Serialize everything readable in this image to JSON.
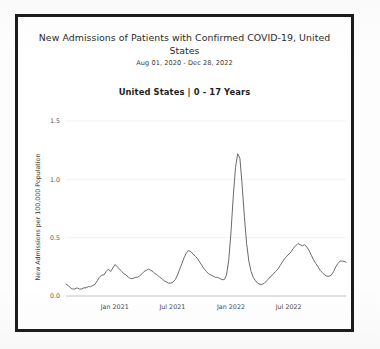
{
  "chart_data": {
    "type": "line",
    "title": "New Admissions of Patients with Confirmed COVID-19, United States",
    "subtitle": "Aug 01, 2020 - Dec 28, 2022",
    "panel_heading": "United States | 0 - 17 Years",
    "xlabel": "",
    "ylabel": "New Admissions per 100,000 Population",
    "ylim": [
      0.0,
      1.5
    ],
    "yticks": [
      0.0,
      0.5,
      1.0,
      1.5
    ],
    "ytick_labels": [
      "0.0",
      "0.5",
      "1.0",
      "1.5"
    ],
    "xlim": [
      "2020-08-01",
      "2022-12-28"
    ],
    "xticks": [
      "2021-01-01",
      "2021-07-01",
      "2022-01-01",
      "2022-07-01"
    ],
    "xtick_labels": [
      "Jan 2021",
      "Jul 2021",
      "Jan 2022",
      "Jul 2022"
    ],
    "grid": true,
    "legend": "none",
    "line_color": "#6a6a6a",
    "line_width": 1.0,
    "series": [
      {
        "name": "0 - 17 Years",
        "x": [
          "2020-08-01",
          "2020-08-08",
          "2020-08-15",
          "2020-08-22",
          "2020-08-29",
          "2020-09-05",
          "2020-09-12",
          "2020-09-19",
          "2020-09-26",
          "2020-10-03",
          "2020-10-10",
          "2020-10-17",
          "2020-10-24",
          "2020-10-31",
          "2020-11-07",
          "2020-11-14",
          "2020-11-21",
          "2020-11-28",
          "2020-12-05",
          "2020-12-12",
          "2020-12-19",
          "2020-12-26",
          "2021-01-02",
          "2021-01-09",
          "2021-01-16",
          "2021-01-23",
          "2021-01-30",
          "2021-02-06",
          "2021-02-13",
          "2021-02-20",
          "2021-02-27",
          "2021-03-06",
          "2021-03-13",
          "2021-03-20",
          "2021-03-27",
          "2021-04-03",
          "2021-04-10",
          "2021-04-17",
          "2021-04-24",
          "2021-05-01",
          "2021-05-08",
          "2021-05-15",
          "2021-05-22",
          "2021-05-29",
          "2021-06-05",
          "2021-06-12",
          "2021-06-19",
          "2021-06-26",
          "2021-07-03",
          "2021-07-10",
          "2021-07-17",
          "2021-07-24",
          "2021-07-31",
          "2021-08-07",
          "2021-08-14",
          "2021-08-21",
          "2021-08-28",
          "2021-09-04",
          "2021-09-11",
          "2021-09-18",
          "2021-09-25",
          "2021-10-02",
          "2021-10-09",
          "2021-10-16",
          "2021-10-23",
          "2021-10-30",
          "2021-11-06",
          "2021-11-13",
          "2021-11-20",
          "2021-11-27",
          "2021-12-04",
          "2021-12-11",
          "2021-12-18",
          "2021-12-25",
          "2022-01-01",
          "2022-01-08",
          "2022-01-15",
          "2022-01-22",
          "2022-01-29",
          "2022-02-05",
          "2022-02-12",
          "2022-02-19",
          "2022-02-26",
          "2022-03-05",
          "2022-03-12",
          "2022-03-19",
          "2022-03-26",
          "2022-04-02",
          "2022-04-09",
          "2022-04-16",
          "2022-04-23",
          "2022-04-30",
          "2022-05-07",
          "2022-05-14",
          "2022-05-21",
          "2022-05-28",
          "2022-06-04",
          "2022-06-11",
          "2022-06-18",
          "2022-06-25",
          "2022-07-02",
          "2022-07-09",
          "2022-07-16",
          "2022-07-23",
          "2022-07-30",
          "2022-08-06",
          "2022-08-13",
          "2022-08-20",
          "2022-08-27",
          "2022-09-03",
          "2022-09-10",
          "2022-09-17",
          "2022-09-24",
          "2022-10-01",
          "2022-10-08",
          "2022-10-15",
          "2022-10-22",
          "2022-10-29",
          "2022-11-05",
          "2022-11-12",
          "2022-11-19",
          "2022-11-26",
          "2022-12-03",
          "2022-12-10",
          "2022-12-17",
          "2022-12-28"
        ],
        "values": [
          0.1,
          0.09,
          0.07,
          0.06,
          0.06,
          0.07,
          0.06,
          0.06,
          0.07,
          0.07,
          0.08,
          0.08,
          0.09,
          0.1,
          0.13,
          0.16,
          0.18,
          0.18,
          0.21,
          0.23,
          0.21,
          0.24,
          0.27,
          0.25,
          0.23,
          0.21,
          0.19,
          0.18,
          0.16,
          0.15,
          0.15,
          0.16,
          0.16,
          0.17,
          0.19,
          0.21,
          0.22,
          0.23,
          0.22,
          0.21,
          0.19,
          0.18,
          0.16,
          0.15,
          0.13,
          0.12,
          0.11,
          0.11,
          0.12,
          0.14,
          0.18,
          0.23,
          0.28,
          0.33,
          0.37,
          0.39,
          0.38,
          0.36,
          0.34,
          0.32,
          0.29,
          0.26,
          0.23,
          0.21,
          0.19,
          0.18,
          0.17,
          0.16,
          0.16,
          0.15,
          0.14,
          0.14,
          0.18,
          0.31,
          0.55,
          0.85,
          1.1,
          1.22,
          1.18,
          0.95,
          0.68,
          0.45,
          0.3,
          0.21,
          0.16,
          0.13,
          0.11,
          0.1,
          0.1,
          0.11,
          0.13,
          0.15,
          0.17,
          0.19,
          0.21,
          0.23,
          0.26,
          0.29,
          0.32,
          0.34,
          0.36,
          0.38,
          0.41,
          0.43,
          0.45,
          0.44,
          0.43,
          0.44,
          0.42,
          0.39,
          0.35,
          0.31,
          0.28,
          0.25,
          0.22,
          0.2,
          0.18,
          0.17,
          0.17,
          0.18,
          0.21,
          0.25,
          0.28,
          0.3,
          0.3,
          0.29
        ]
      }
    ]
  }
}
